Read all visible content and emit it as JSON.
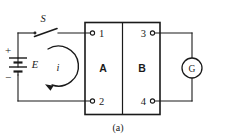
{
  "figure": {
    "caption": "(a)",
    "type": "electrical-circuit-schematic"
  },
  "source_branch": {
    "switch_label": "S",
    "switch_state": "open",
    "battery_label": "E",
    "battery_positive_sign": "+",
    "battery_negative_sign": "−",
    "current_label": "i",
    "current_direction": "counter-clockwise"
  },
  "network": {
    "block_a_label": "A",
    "block_b_label": "B",
    "terminals": [
      {
        "id": "1",
        "label": "1",
        "side": "left",
        "position": "top"
      },
      {
        "id": "2",
        "label": "2",
        "side": "left",
        "position": "bottom"
      },
      {
        "id": "3",
        "label": "3",
        "side": "right",
        "position": "top"
      },
      {
        "id": "4",
        "label": "4",
        "side": "right",
        "position": "bottom"
      }
    ]
  },
  "measurement_branch": {
    "meter_label": "G",
    "meter_type": "galvanometer"
  },
  "colors": {
    "ink": "#1a1a1a",
    "background": "#ffffff"
  }
}
